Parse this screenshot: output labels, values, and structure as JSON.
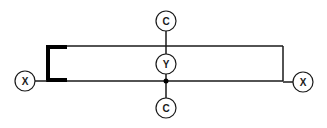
{
  "diagram": {
    "colors": {
      "stroke": "#1a1a1a",
      "background": "#ffffff"
    },
    "nodes": [
      {
        "id": "x-left",
        "label": "X",
        "cx": 25,
        "cy": 81,
        "r": 10
      },
      {
        "id": "x-right",
        "label": "X",
        "cx": 303,
        "cy": 82,
        "r": 10
      },
      {
        "id": "c-top",
        "label": "C",
        "cx": 166,
        "cy": 21,
        "r": 10
      },
      {
        "id": "y-center",
        "label": "Y",
        "cx": 166,
        "cy": 64,
        "r": 10
      },
      {
        "id": "c-bottom",
        "label": "C",
        "cx": 166,
        "cy": 108,
        "r": 10
      }
    ],
    "labels": {
      "x_left": "X",
      "x_right": "X",
      "c_top": "C",
      "y_center": "Y",
      "c_bottom": "C"
    }
  }
}
